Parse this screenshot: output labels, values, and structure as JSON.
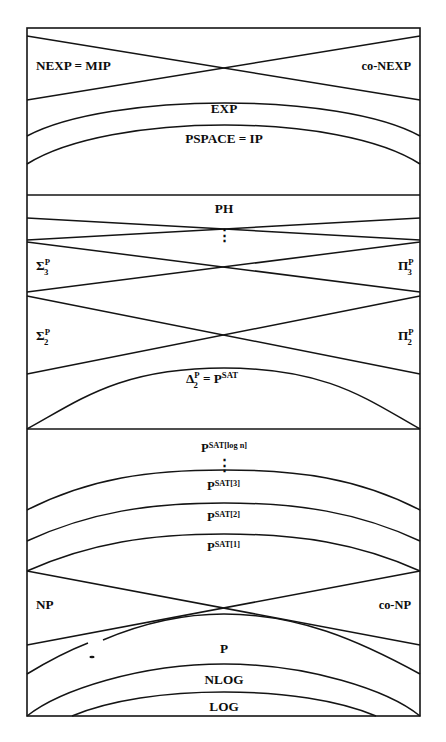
{
  "diagram": {
    "frame": {
      "left": 27,
      "right": 420,
      "top": 28,
      "bottom": 716,
      "stroke": "#141414"
    },
    "dividers": [
      {
        "name": "divider-below-pspace",
        "y": 195
      },
      {
        "name": "divider-below-delta2p",
        "y": 429
      }
    ],
    "regions": [
      {
        "id": "nexp",
        "label": "NEXP = MIP",
        "x": 36,
        "y": 70,
        "anchor": "start",
        "size": "sz-main"
      },
      {
        "id": "co-nexp",
        "label": "co-NEXP",
        "x": 411,
        "y": 70,
        "anchor": "end",
        "size": "sz-side"
      },
      {
        "id": "exp",
        "label": "EXP",
        "x": 224,
        "y": 113,
        "anchor": "middle",
        "size": "sz-main"
      },
      {
        "id": "pspace",
        "label": "PSPACE = IP",
        "x": 224,
        "y": 143,
        "anchor": "middle",
        "size": "sz-main"
      },
      {
        "id": "ph",
        "label": "PH",
        "x": 224,
        "y": 213,
        "anchor": "middle",
        "size": "sz-main"
      },
      {
        "id": "sigma3p",
        "label": "Σ",
        "superscript": "P",
        "subscript": "3",
        "x": 36,
        "y": 270,
        "anchor": "start",
        "size": "sz-main"
      },
      {
        "id": "pi3p",
        "label": "Π",
        "superscript": "P",
        "subscript": "3",
        "x": 398,
        "y": 270,
        "anchor": "start",
        "size": "sz-main"
      },
      {
        "id": "sigma2p",
        "label": "Σ",
        "superscript": "P",
        "subscript": "2",
        "x": 36,
        "y": 340,
        "anchor": "start",
        "size": "sz-main"
      },
      {
        "id": "pi2p",
        "label": "Π",
        "superscript": "P",
        "subscript": "2",
        "x": 398,
        "y": 340,
        "anchor": "start",
        "size": "sz-main"
      },
      {
        "id": "delta2p",
        "label": "Δ",
        "subscript": "2",
        "superscript": "P",
        "suffix": "= P",
        "suffix_sup": "SAT",
        "x": 186,
        "y": 383,
        "anchor": "start",
        "size": "sz-main"
      },
      {
        "id": "psat-logn",
        "label": "P",
        "superscript": "SAT[log n]",
        "x": 201,
        "y": 452,
        "anchor": "start",
        "size": "sz-sat"
      },
      {
        "id": "psat-3",
        "label": "P",
        "superscript": "SAT[3]",
        "x": 207,
        "y": 490,
        "anchor": "start",
        "size": "sz-sat"
      },
      {
        "id": "psat-2",
        "label": "P",
        "superscript": "SAT[2]",
        "x": 207,
        "y": 521,
        "anchor": "start",
        "size": "sz-sat"
      },
      {
        "id": "psat-1",
        "label": "P",
        "superscript": "SAT[1]",
        "x": 207,
        "y": 551,
        "anchor": "start",
        "size": "sz-sat"
      },
      {
        "id": "np",
        "label": "NP",
        "x": 36,
        "y": 609,
        "anchor": "start",
        "size": "sz-main"
      },
      {
        "id": "co-np",
        "label": "co-NP",
        "x": 411,
        "y": 609,
        "anchor": "end",
        "size": "sz-side"
      },
      {
        "id": "p",
        "label": "P",
        "x": 224,
        "y": 653,
        "anchor": "middle",
        "size": "sz-main"
      },
      {
        "id": "nlog",
        "label": "NLOG",
        "x": 224,
        "y": 684,
        "anchor": "middle",
        "size": "sz-main"
      },
      {
        "id": "log",
        "label": "LOG",
        "x": 224,
        "y": 711,
        "anchor": "middle",
        "size": "sz-main"
      }
    ],
    "ellipses_markers": [
      {
        "name": "vdots-ph",
        "x": 224,
        "y": 237
      },
      {
        "name": "vdots-psat",
        "x": 224,
        "y": 467
      }
    ],
    "curves": [
      {
        "name": "nexp-upper-diagonal",
        "d": "M 27 36 L 420 100"
      },
      {
        "name": "conexp-upper-diagonal",
        "d": "M 420 36 L 27 100"
      },
      {
        "name": "exp-boundary",
        "d": "M 27 136 C 110 92, 340 92, 420 136"
      },
      {
        "name": "pspace-boundary",
        "d": "M 27 164 C 110 112, 340 112, 420 164"
      },
      {
        "name": "sigma4-line",
        "d": "M 27 218 L 420 240"
      },
      {
        "name": "pi4-line",
        "d": "M 420 218 L 27 240"
      },
      {
        "name": "sigma3-line",
        "d": "M 27 242 L 420 292"
      },
      {
        "name": "pi3-line",
        "d": "M 420 242 L 27 292"
      },
      {
        "name": "sigma2-line",
        "d": "M 27 296 L 420 374"
      },
      {
        "name": "pi2-line",
        "d": "M 420 296 L 27 374"
      },
      {
        "name": "delta2-boundary",
        "d": "M 27 429 C 80 400, 120 368, 224 368 C 328 368, 368 400, 420 429"
      },
      {
        "name": "psat3-boundary",
        "d": "M 27 510 C 90 478, 150 470, 224 470 C 298 470, 358 478, 420 510"
      },
      {
        "name": "psat2-boundary",
        "d": "M 27 541 C 90 512, 150 503, 224 503 C 298 503, 358 512, 420 541"
      },
      {
        "name": "psat1-boundary",
        "d": "M 27 571 C 90 543, 150 534, 224 534 C 298 534, 358 543, 420 571"
      },
      {
        "name": "np-diagonal",
        "d": "M 27 571 L 420 645"
      },
      {
        "name": "conp-diagonal",
        "d": "M 420 571 L 27 645"
      },
      {
        "name": "p-boundary-right",
        "d": "M 103 640 C 150 620, 190 614, 224 614 C 298 614, 358 640, 420 674"
      },
      {
        "name": "p-boundary-left",
        "d": "M 27 674 C 50 660, 70 650, 88 643"
      },
      {
        "name": "nlog-boundary",
        "d": "M 27 716 C 60 690, 140 664, 224 664 C 308 664, 388 690, 420 716"
      },
      {
        "name": "log-boundary",
        "d": "M 72 716 C 110 700, 165 692, 224 692 C 283 692, 338 700, 376 716"
      }
    ],
    "speck": {
      "name": "tilde-speck",
      "x": 92,
      "y": 657
    }
  }
}
